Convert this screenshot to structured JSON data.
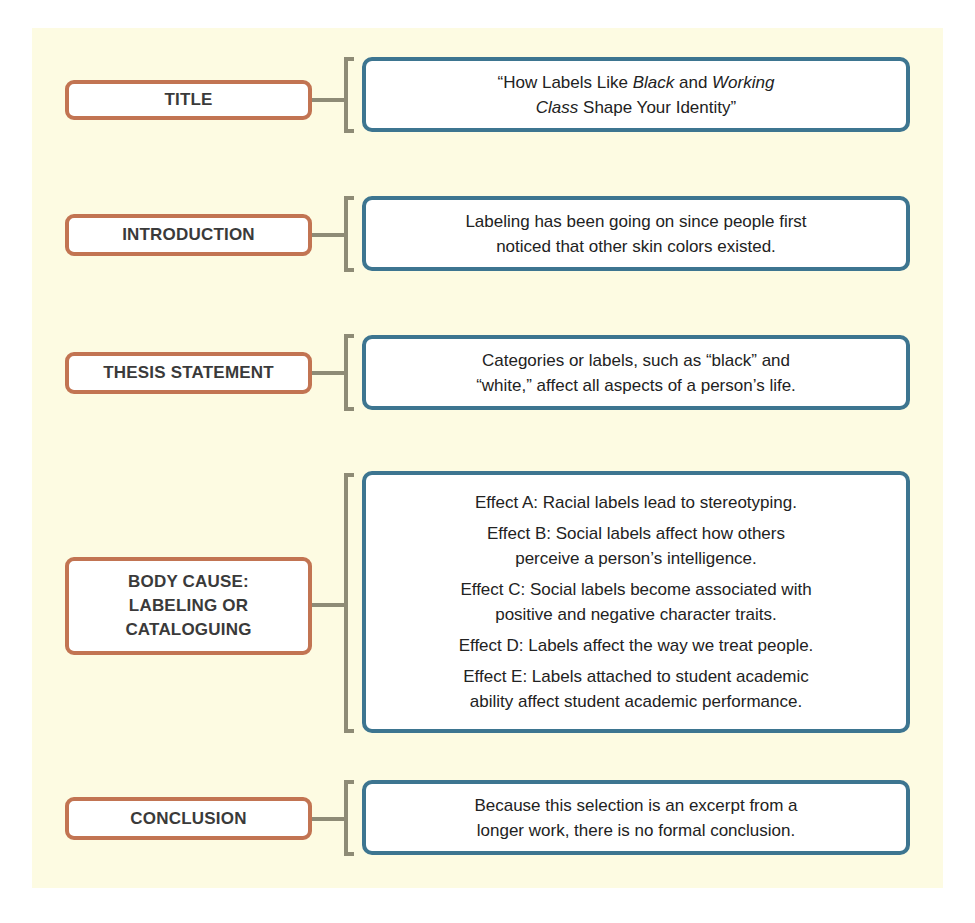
{
  "diagram": {
    "type": "essay-structure-organizer",
    "colors": {
      "panel_background": "#fdfbe2",
      "label_border": "#c27452",
      "content_border": "#3d7590",
      "connector": "#8e8b76",
      "text": "#222222"
    },
    "rows": [
      {
        "label": "TITLE",
        "content_parts": [
          "“How Labels Like ",
          "Black",
          " and ",
          "Working",
          "\n",
          "Class",
          " Shape Your Identity”"
        ]
      },
      {
        "label": "INTRODUCTION",
        "content": "Labeling has been going on since people first\nnoticed that other skin colors existed."
      },
      {
        "label": "THESIS STATEMENT",
        "content": "Categories or labels, such as “black” and\n“white,” affect all aspects of a person’s life."
      },
      {
        "label": "BODY CAUSE:\nLABELING OR\nCATALOGUING",
        "effects": [
          "Effect A: Racial labels lead to stereotyping.",
          "Effect B: Social labels affect how others\nperceive a person’s intelligence.",
          "Effect C: Social labels become associated with\npositive and negative character traits.",
          "Effect D: Labels affect the way we treat people.",
          "Effect E: Labels attached to student academic\nability affect student academic performance."
        ]
      },
      {
        "label": "CONCLUSION",
        "content": "Because this selection is an excerpt from a\nlonger work, there is no formal conclusion."
      }
    ]
  }
}
